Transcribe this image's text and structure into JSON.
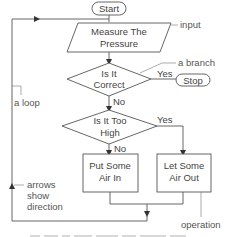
{
  "diagram": {
    "type": "flowchart",
    "nodes": {
      "start": {
        "label": "Start",
        "shape": "terminal"
      },
      "measure": {
        "line1": "Measure The",
        "line2": "Pressure",
        "shape": "parallelogram"
      },
      "correct": {
        "line1": "Is It",
        "line2": "Correct",
        "shape": "diamond"
      },
      "stop": {
        "label": "Stop",
        "shape": "terminal"
      },
      "too_high": {
        "line1": "Is It Too",
        "line2": "High",
        "shape": "diamond"
      },
      "put_air": {
        "line1": "Put Some",
        "line2": "Air In",
        "shape": "rectangle"
      },
      "let_air": {
        "line1": "Let Some",
        "line2": "Air Out",
        "shape": "rectangle"
      }
    },
    "edges": {
      "correct_yes": "Yes",
      "correct_no": "No",
      "too_high_yes": "Yes",
      "too_high_no": "No"
    },
    "annotations": {
      "input": "input",
      "branch": "a branch",
      "loop": "a loop",
      "arrows_line1": "arrows",
      "arrows_line2": "show",
      "arrows_line3": "direction",
      "operation": "operation"
    },
    "colors": {
      "stroke": "#555555",
      "text": "#444444",
      "background": "#ffffff"
    }
  }
}
